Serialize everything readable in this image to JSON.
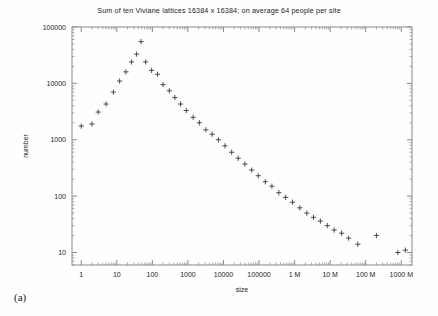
{
  "figure": {
    "panel_label": "(a)",
    "background_color": "#fefefe",
    "frame_color": "#8a8a8a",
    "marker_color": "#3a3a3a"
  },
  "chart_data": {
    "type": "scatter",
    "title": "Sum of ten Viviane lattices 16384 x 16384; on average 64 people per site",
    "xlabel": "size",
    "ylabel": "number",
    "xscale": "log",
    "yscale": "log",
    "xlim": [
      0.55,
      2000000000
    ],
    "ylim": [
      6,
      100000
    ],
    "grid": false,
    "legend": null,
    "marker": "+",
    "xticks": [
      1,
      10,
      100,
      1000,
      10000,
      100000,
      1000000,
      10000000,
      100000000,
      1000000000
    ],
    "xtick_labels": [
      "1",
      "10",
      "100",
      "1000",
      "10000",
      "100000",
      "1 M",
      "10 M",
      "100 M",
      "1000 M"
    ],
    "yticks": [
      10,
      100,
      1000,
      10000,
      100000
    ],
    "ytick_labels": [
      "10",
      "100",
      "1000",
      "10000",
      "100000"
    ],
    "points": [
      {
        "x": 1,
        "y": 1750
      },
      {
        "x": 2,
        "y": 1900
      },
      {
        "x": 3,
        "y": 3100
      },
      {
        "x": 5,
        "y": 4300
      },
      {
        "x": 8,
        "y": 7000
      },
      {
        "x": 12,
        "y": 11000
      },
      {
        "x": 18,
        "y": 16000
      },
      {
        "x": 26,
        "y": 24000
      },
      {
        "x": 36,
        "y": 33000
      },
      {
        "x": 48,
        "y": 55000
      },
      {
        "x": 65,
        "y": 24000
      },
      {
        "x": 95,
        "y": 17000
      },
      {
        "x": 140,
        "y": 14500
      },
      {
        "x": 200,
        "y": 9500
      },
      {
        "x": 300,
        "y": 7400
      },
      {
        "x": 430,
        "y": 5600
      },
      {
        "x": 620,
        "y": 4300
      },
      {
        "x": 900,
        "y": 3300
      },
      {
        "x": 1400,
        "y": 2500
      },
      {
        "x": 2100,
        "y": 2000
      },
      {
        "x": 3200,
        "y": 1500
      },
      {
        "x": 4800,
        "y": 1250
      },
      {
        "x": 7200,
        "y": 1000
      },
      {
        "x": 11000,
        "y": 780
      },
      {
        "x": 17000,
        "y": 600
      },
      {
        "x": 26000,
        "y": 470
      },
      {
        "x": 40000,
        "y": 370
      },
      {
        "x": 62000,
        "y": 290
      },
      {
        "x": 95000,
        "y": 230
      },
      {
        "x": 150000,
        "y": 180
      },
      {
        "x": 230000,
        "y": 150
      },
      {
        "x": 360000,
        "y": 115
      },
      {
        "x": 560000,
        "y": 95
      },
      {
        "x": 870000,
        "y": 78
      },
      {
        "x": 1400000,
        "y": 62
      },
      {
        "x": 2200000,
        "y": 50
      },
      {
        "x": 3400000,
        "y": 42
      },
      {
        "x": 5300000,
        "y": 36
      },
      {
        "x": 8300000,
        "y": 30
      },
      {
        "x": 13000000,
        "y": 25
      },
      {
        "x": 21000000,
        "y": 22
      },
      {
        "x": 33000000,
        "y": 18
      },
      {
        "x": 60000000,
        "y": 14
      },
      {
        "x": 200000000,
        "y": 20
      },
      {
        "x": 800000000,
        "y": 10
      },
      {
        "x": 1300000000,
        "y": 11
      }
    ]
  }
}
